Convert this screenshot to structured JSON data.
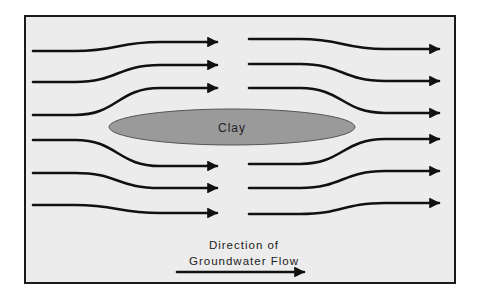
{
  "diagram": {
    "clay_label": "Clay",
    "legend": {
      "line1": "Direction of",
      "line2": "Groundwater Flow"
    },
    "colors": {
      "background": "#ececec",
      "clay_fill": "#9a9a9a",
      "lines": "#111111"
    },
    "flow_lines_left": [
      {
        "start_y": 51,
        "end_y": 42
      },
      {
        "start_y": 82,
        "end_y": 65
      },
      {
        "start_y": 115,
        "end_y": 88
      },
      {
        "start_y": 140,
        "end_y": 166
      },
      {
        "start_y": 173,
        "end_y": 188
      },
      {
        "start_y": 205,
        "end_y": 213
      }
    ],
    "flow_lines_right": [
      {
        "start_y": 39,
        "end_y": 49
      },
      {
        "start_y": 64,
        "end_y": 81
      },
      {
        "start_y": 88,
        "end_y": 113
      },
      {
        "start_y": 164,
        "end_y": 139
      },
      {
        "start_y": 188,
        "end_y": 171
      },
      {
        "start_y": 214,
        "end_y": 203
      }
    ]
  }
}
